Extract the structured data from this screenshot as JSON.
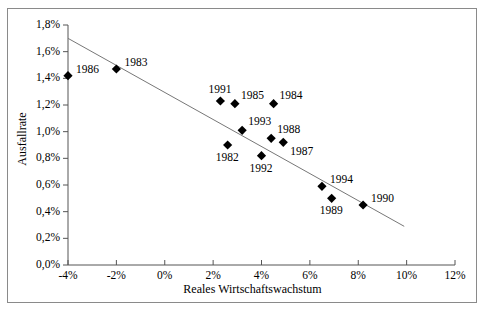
{
  "chart_data": {
    "type": "scatter",
    "title": "",
    "xlabel": "Reales Wirtschaftswachstum",
    "ylabel": "Ausfallrate",
    "xlim": [
      -4,
      12
    ],
    "ylim": [
      0.0,
      1.8
    ],
    "grid": false,
    "legend": "none",
    "x_tick_labels": [
      "-4%",
      "-2%",
      "0%",
      "2%",
      "4%",
      "6%",
      "8%",
      "10%",
      "12%"
    ],
    "x_tick_values": [
      -4,
      -2,
      0,
      2,
      4,
      6,
      8,
      10,
      12
    ],
    "y_tick_labels": [
      "0,0%",
      "0,2%",
      "0,4%",
      "0,6%",
      "0,8%",
      "1,0%",
      "1,2%",
      "1,4%",
      "1,6%",
      "1,8%"
    ],
    "y_tick_values": [
      0.0,
      0.2,
      0.4,
      0.6,
      0.8,
      1.0,
      1.2,
      1.4,
      1.6,
      1.8
    ],
    "marker": "filled-diamond",
    "marker_color": "#000000",
    "trendline": {
      "x": [
        -4.0,
        9.9
      ],
      "y": [
        1.7,
        0.29
      ],
      "color": "#777777"
    },
    "points": [
      {
        "label": "1986",
        "x": -4.0,
        "y": 1.42,
        "label_pos": "right"
      },
      {
        "label": "1983",
        "x": -2.0,
        "y": 1.47,
        "label_pos": "right"
      },
      {
        "label": "1991",
        "x": 2.3,
        "y": 1.23,
        "label_pos": "above"
      },
      {
        "label": "1985",
        "x": 2.9,
        "y": 1.21,
        "label_pos": "above-right"
      },
      {
        "label": "1984",
        "x": 4.5,
        "y": 1.21,
        "label_pos": "above-right"
      },
      {
        "label": "1993",
        "x": 3.2,
        "y": 1.01,
        "label_pos": "above-right"
      },
      {
        "label": "1988",
        "x": 4.4,
        "y": 0.95,
        "label_pos": "above-right"
      },
      {
        "label": "1987",
        "x": 4.9,
        "y": 0.92,
        "label_pos": "below-right"
      },
      {
        "label": "1982",
        "x": 2.6,
        "y": 0.9,
        "label_pos": "below"
      },
      {
        "label": "1992",
        "x": 4.0,
        "y": 0.82,
        "label_pos": "below"
      },
      {
        "label": "1994",
        "x": 6.5,
        "y": 0.59,
        "label_pos": "right"
      },
      {
        "label": "1989",
        "x": 6.9,
        "y": 0.5,
        "label_pos": "below"
      },
      {
        "label": "1990",
        "x": 8.2,
        "y": 0.45,
        "label_pos": "right"
      }
    ]
  }
}
